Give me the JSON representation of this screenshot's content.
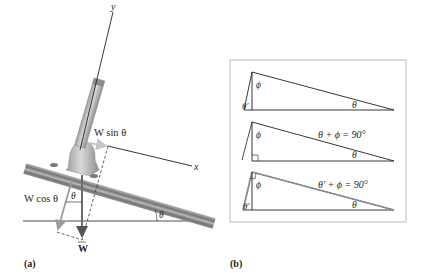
{
  "figure": {
    "panel_a": {
      "label": "(a)",
      "axis_y_label": "y",
      "axis_x_label": "x",
      "w_sin_label": "W sin θ",
      "w_cos_label": "W cos θ",
      "w_vector_label": "W",
      "angle_at_vector": "θ",
      "angle_incline": "θ"
    },
    "panel_b": {
      "label": "(b)",
      "triangle_1": {
        "angle_left": "θ′",
        "angle_top": "ϕ",
        "angle_right": "θ"
      },
      "triangle_2": {
        "angle_top": "ϕ",
        "angle_right": "θ",
        "equation": "θ + ϕ = 90°"
      },
      "triangle_3": {
        "angle_left": "θ′",
        "angle_top": "ϕ",
        "angle_right": "θ",
        "equation": "θ′ + ϕ = 90°"
      }
    },
    "colors": {
      "line": "#231f20",
      "gray_vector": "#8a8c8e",
      "rail": "#8f8f8f",
      "post": "#b9b9b9",
      "box_border": "#a7a9ac"
    }
  }
}
